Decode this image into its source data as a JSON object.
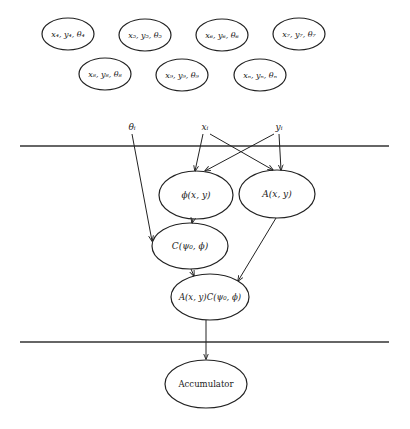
{
  "colors": {
    "stroke": "#222222",
    "background": "#ffffff"
  },
  "top_nodes": [
    {
      "label": "x₄, y₄, θ₄",
      "cx": 68,
      "cy": 34
    },
    {
      "label": "x₅, y₅, θ₅",
      "cx": 145,
      "cy": 35
    },
    {
      "label": "x₆, y₆, θ₆",
      "cx": 222,
      "cy": 35
    },
    {
      "label": "x₇, y₇, θ₇",
      "cx": 299,
      "cy": 34
    },
    {
      "label": "x₈, y₈, θ₈",
      "cx": 105,
      "cy": 74
    },
    {
      "label": "x₉, y₉, θ₉",
      "cx": 182,
      "cy": 75
    },
    {
      "label": "xₙ, yₙ, θₙ",
      "cx": 260,
      "cy": 75
    }
  ],
  "inputs": {
    "theta": "θᵢ",
    "x": "xᵢ",
    "y": "yᵢ"
  },
  "nodes": {
    "phi": "ϕ(x, y)",
    "A": "A(x, y)",
    "C": "C(ψ₀, ϕ)",
    "AC": "A(x, y)C(ψ₀, ϕ)",
    "accumulator": "Accumulator"
  }
}
